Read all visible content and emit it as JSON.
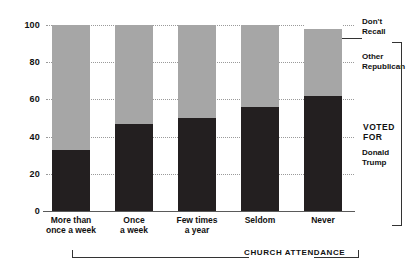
{
  "chart_data": {
    "type": "bar",
    "subtype": "stacked-column-100",
    "title": "",
    "xlabel": "CHURCH ATTENDANCE",
    "ylabel": "",
    "ylim": [
      0,
      100
    ],
    "yticks": [
      0,
      20,
      40,
      60,
      80,
      100
    ],
    "ytick_labels": [
      "0",
      "20",
      "40",
      "60",
      "80",
      "100"
    ],
    "grid": true,
    "legend_position": "right",
    "categories": [
      "More than once a week",
      "Once a week",
      "Few times a year",
      "Seldom",
      "Never"
    ],
    "category_lines": [
      [
        "More than",
        "once a week"
      ],
      [
        "Once",
        "a week"
      ],
      [
        "Few times",
        "a year"
      ],
      [
        "Seldom"
      ],
      [
        "Never"
      ]
    ],
    "series": [
      {
        "name": "Donald Trump",
        "color": "#231f20",
        "values": [
          33,
          47,
          50,
          56,
          62
        ]
      },
      {
        "name": "Other Republican",
        "color": "#a6a6a6",
        "values": [
          67,
          53,
          50,
          44,
          36
        ]
      },
      {
        "name": "Don't Recall",
        "color": "#ffffff",
        "values": [
          0,
          0,
          0,
          0,
          2
        ]
      }
    ],
    "annotations": {
      "group_label": "VOTED FOR",
      "axis_bracket_label": "CHURCH ATTENDANCE"
    }
  },
  "legend": {
    "dont_recall": {
      "line1": "Don't",
      "line2": "Recall"
    },
    "other_republican": {
      "line1": "Other",
      "line2": "Republican"
    },
    "donald_trump": {
      "line1": "Donald",
      "line2": "Trump"
    },
    "voted_for": {
      "line1": "VOTED",
      "line2": "FOR"
    }
  },
  "axis": {
    "x_caption": "CHURCH ATTENDANCE"
  },
  "colors": {
    "trump": "#231f20",
    "other_republican": "#a6a6a6",
    "dont_recall": "#ffffff",
    "gridline": "#9a9a9a",
    "text": "#111111"
  }
}
